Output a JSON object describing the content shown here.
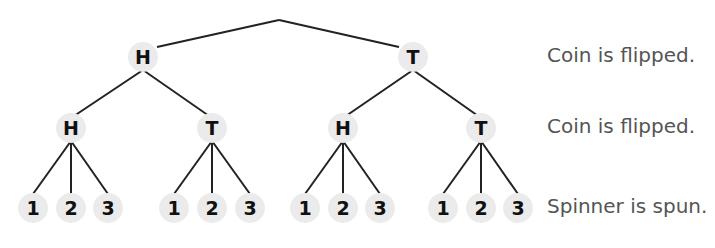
{
  "diagram": {
    "line_color": "#222222",
    "node_color": "#ebebeb",
    "root": {
      "x": 279,
      "y": 20
    },
    "nodes": [
      {
        "id": "l1-h",
        "label": "H",
        "x": 143,
        "y": 57,
        "parent": "root"
      },
      {
        "id": "l1-t",
        "label": "T",
        "x": 413,
        "y": 57,
        "parent": "root"
      },
      {
        "id": "l2-hh",
        "label": "H",
        "x": 71,
        "y": 128,
        "parent": "l1-h"
      },
      {
        "id": "l2-ht",
        "label": "T",
        "x": 212,
        "y": 128,
        "parent": "l1-h"
      },
      {
        "id": "l2-th",
        "label": "H",
        "x": 343,
        "y": 128,
        "parent": "l1-t"
      },
      {
        "id": "l2-tt",
        "label": "T",
        "x": 481,
        "y": 128,
        "parent": "l1-t"
      },
      {
        "id": "l3-hh1",
        "label": "1",
        "x": 33,
        "y": 208,
        "parent": "l2-hh"
      },
      {
        "id": "l3-hh2",
        "label": "2",
        "x": 71,
        "y": 208,
        "parent": "l2-hh"
      },
      {
        "id": "l3-hh3",
        "label": "3",
        "x": 108,
        "y": 208,
        "parent": "l2-hh"
      },
      {
        "id": "l3-ht1",
        "label": "1",
        "x": 174,
        "y": 208,
        "parent": "l2-ht"
      },
      {
        "id": "l3-ht2",
        "label": "2",
        "x": 212,
        "y": 208,
        "parent": "l2-ht"
      },
      {
        "id": "l3-ht3",
        "label": "3",
        "x": 250,
        "y": 208,
        "parent": "l2-ht"
      },
      {
        "id": "l3-th1",
        "label": "1",
        "x": 305,
        "y": 208,
        "parent": "l2-th"
      },
      {
        "id": "l3-th2",
        "label": "2",
        "x": 343,
        "y": 208,
        "parent": "l2-th"
      },
      {
        "id": "l3-th3",
        "label": "3",
        "x": 380,
        "y": 208,
        "parent": "l2-th"
      },
      {
        "id": "l3-tt1",
        "label": "1",
        "x": 443,
        "y": 208,
        "parent": "l2-tt"
      },
      {
        "id": "l3-tt2",
        "label": "2",
        "x": 481,
        "y": 208,
        "parent": "l2-tt"
      },
      {
        "id": "l3-tt3",
        "label": "3",
        "x": 518,
        "y": 208,
        "parent": "l2-tt"
      }
    ],
    "stage_labels": [
      {
        "text": "Coin is flipped.",
        "x": 547,
        "y": 57
      },
      {
        "text": "Coin is flipped.",
        "x": 547,
        "y": 128
      },
      {
        "text": "Spinner is spun.",
        "x": 547,
        "y": 208
      }
    ]
  }
}
